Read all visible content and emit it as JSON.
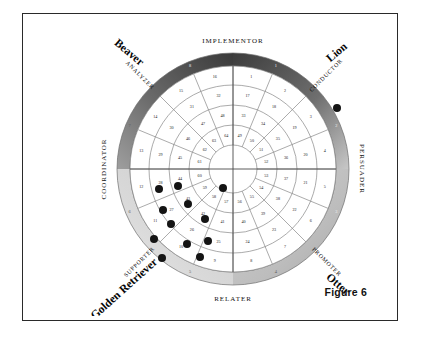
{
  "figure": {
    "caption": "Figure 6"
  },
  "chart_data": {
    "type": "scatter",
    "subtype": "polar-grid-wheel",
    "center": {
      "x": 150,
      "y": 133
    },
    "geometry": {
      "sectors": 16,
      "rings": 4,
      "ring_radii": [
        116,
        103,
        84,
        64,
        44,
        24
      ],
      "band_outer_r": 116,
      "band_inner_r": 103,
      "sector_start_deg": -90,
      "grid": true
    },
    "axis_labels": [
      {
        "text": "IMPLEMENTOR",
        "position": "top"
      },
      {
        "text": "PERSUADER",
        "position": "right"
      },
      {
        "text": "RELATER",
        "position": "bottom"
      },
      {
        "text": "COORDINATOR",
        "position": "left"
      }
    ],
    "role_labels": [
      {
        "text": "ANALYZER",
        "position": "upper-left"
      },
      {
        "text": "CONDUCTOR",
        "position": "upper-right"
      },
      {
        "text": "PROMOTER",
        "position": "lower-right"
      },
      {
        "text": "SUPPORTER",
        "position": "lower-left"
      }
    ],
    "animal_labels": [
      {
        "text": "Beaver",
        "position": "upper-left"
      },
      {
        "text": "Lion",
        "position": "upper-right"
      },
      {
        "text": "Otter",
        "position": "lower-right"
      },
      {
        "text": "Golden Retriever",
        "position": "lower-left"
      }
    ],
    "ring_numbers": {
      "ring1_outer": [
        1,
        2,
        3,
        4,
        5,
        6,
        7,
        8,
        9,
        10,
        11,
        12,
        13,
        14,
        15,
        16
      ],
      "ring2": [
        17,
        18,
        19,
        20,
        21,
        22,
        23,
        24,
        25,
        26,
        27,
        28,
        29,
        30,
        31,
        32
      ],
      "ring3": [
        33,
        34,
        35,
        36,
        37,
        38,
        39,
        40,
        41,
        42,
        43,
        44,
        45,
        46,
        47,
        48
      ],
      "ring4_inner": [
        49,
        50,
        51,
        52,
        53,
        54,
        55,
        56,
        57,
        58,
        59,
        60,
        61,
        62,
        63,
        64
      ]
    },
    "band_quadrant_numbers": [
      {
        "value": 1,
        "deg": 22.5
      },
      {
        "value": 2,
        "deg": 67.5
      },
      {
        "value": 3,
        "deg": 112.5
      },
      {
        "value": 4,
        "deg": 157.5
      },
      {
        "value": 5,
        "deg": 202.5
      },
      {
        "value": 6,
        "deg": 247.5
      },
      {
        "value": 7,
        "deg": 292.5
      },
      {
        "value": 8,
        "deg": 337.5
      }
    ],
    "markers": {
      "label": "response plot dots",
      "color": "#141414",
      "radius_px": 4.0,
      "points": [
        {
          "x": 254,
          "y": 72,
          "zone": "CONDUCTOR band"
        },
        {
          "x": 76,
          "y": 153,
          "zone": "ring2 / 21-37"
        },
        {
          "x": 95,
          "y": 150,
          "zone": "ring2 / 37-53"
        },
        {
          "x": 140,
          "y": 152,
          "zone": "ring4 / 52"
        },
        {
          "x": 80,
          "y": 174,
          "zone": "ring2 / 20-36"
        },
        {
          "x": 105,
          "y": 168,
          "zone": "ring3 / 36-52"
        },
        {
          "x": 88,
          "y": 188,
          "zone": "ring2 / 20-36"
        },
        {
          "x": 122,
          "y": 183,
          "zone": "ring3 / 35-51"
        },
        {
          "x": 71,
          "y": 203,
          "zone": "ring1 / 19-20"
        },
        {
          "x": 104,
          "y": 208,
          "zone": "ring2 / 19-35"
        },
        {
          "x": 125,
          "y": 205,
          "zone": "ring3 / 34-50"
        },
        {
          "x": 79,
          "y": 222,
          "zone": "ring1 / 18-19"
        },
        {
          "x": 117,
          "y": 221,
          "zone": "ring2 / 18-34"
        }
      ]
    },
    "colors": {
      "band_dark": "#4a4a4a",
      "band_darkest": "#3a3a3a",
      "band_light": "#d8d8d8",
      "band_mid": "#9a9a9a",
      "grid_line": "#7d7d7d",
      "text": "#121212",
      "marker": "#141414",
      "frame": "#2a2a2a",
      "page_bg": "#ffffff"
    }
  }
}
